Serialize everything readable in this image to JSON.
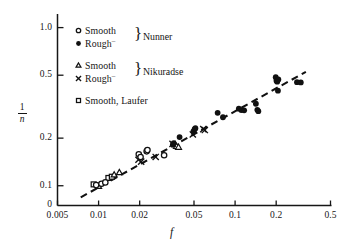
{
  "chart_data": {
    "type": "scatter",
    "title": "",
    "subtitle": "",
    "xlabel": "f",
    "ylabel": "1/n",
    "ylabel_numerator": "1",
    "ylabel_denominator": "n",
    "xscale": "log",
    "yscale": "log",
    "xlim": [
      0.005,
      0.5
    ],
    "ylim": [
      0.075,
      1.15
    ],
    "grid": false,
    "legend_position": "upper-left-inside",
    "xticks": [
      0.005,
      0.01,
      0.02,
      0.05,
      0.1,
      0.2,
      0.5
    ],
    "xticklabels": [
      "0.005",
      "0.01",
      "0.02",
      "0.05",
      "0.1",
      "0.2",
      "0.5"
    ],
    "yticks": [
      1.0,
      0.5,
      0.2,
      0.1
    ],
    "yticklabels": [
      "1.0",
      "0.5",
      "0.2",
      "0.1"
    ],
    "origin_label": "0",
    "annotations": [
      {
        "name": "trend-line",
        "type": "dashed-line",
        "x": [
          0.0074,
          0.33
        ],
        "y": [
          0.0845,
          0.525
        ]
      }
    ],
    "series": [
      {
        "name": "Smooth, Nunner",
        "marker": "open-circle",
        "source": "Nunner",
        "surface": "Smooth",
        "points": [
          {
            "x": 0.0096,
            "y": 0.101
          },
          {
            "x": 0.0105,
            "y": 0.103
          },
          {
            "x": 0.0112,
            "y": 0.105
          },
          {
            "x": 0.0197,
            "y": 0.158
          },
          {
            "x": 0.0203,
            "y": 0.152
          },
          {
            "x": 0.0225,
            "y": 0.165
          },
          {
            "x": 0.0228,
            "y": 0.168
          },
          {
            "x": 0.0302,
            "y": 0.156
          }
        ]
      },
      {
        "name": "Rough, Nunner",
        "marker": "filled-circle",
        "source": "Nunner",
        "surface": "Rough",
        "points": [
          {
            "x": 0.035,
            "y": 0.182
          },
          {
            "x": 0.0355,
            "y": 0.186
          },
          {
            "x": 0.0392,
            "y": 0.203
          },
          {
            "x": 0.0495,
            "y": 0.221
          },
          {
            "x": 0.0505,
            "y": 0.228
          },
          {
            "x": 0.0512,
            "y": 0.231
          },
          {
            "x": 0.0745,
            "y": 0.289
          },
          {
            "x": 0.0815,
            "y": 0.271
          },
          {
            "x": 0.1065,
            "y": 0.307
          },
          {
            "x": 0.111,
            "y": 0.301
          },
          {
            "x": 0.1165,
            "y": 0.3
          },
          {
            "x": 0.142,
            "y": 0.33
          },
          {
            "x": 0.1455,
            "y": 0.302
          },
          {
            "x": 0.148,
            "y": 0.296
          },
          {
            "x": 0.1985,
            "y": 0.486
          },
          {
            "x": 0.201,
            "y": 0.462
          },
          {
            "x": 0.2035,
            "y": 0.455
          },
          {
            "x": 0.206,
            "y": 0.399
          },
          {
            "x": 0.2075,
            "y": 0.47
          },
          {
            "x": 0.284,
            "y": 0.452
          },
          {
            "x": 0.303,
            "y": 0.45
          }
        ]
      },
      {
        "name": "Smooth, Nikuradse",
        "marker": "open-triangle",
        "source": "Nikuradse",
        "surface": "Smooth",
        "points": [
          {
            "x": 0.01,
            "y": 0.099
          },
          {
            "x": 0.013,
            "y": 0.117
          },
          {
            "x": 0.0142,
            "y": 0.121
          },
          {
            "x": 0.0372,
            "y": 0.177
          },
          {
            "x": 0.0385,
            "y": 0.175
          }
        ]
      },
      {
        "name": "Rough, Nikuradse",
        "marker": "cross",
        "source": "Nikuradse",
        "surface": "Rough",
        "points": [
          {
            "x": 0.0196,
            "y": 0.146
          },
          {
            "x": 0.0205,
            "y": 0.142
          },
          {
            "x": 0.0262,
            "y": 0.152
          },
          {
            "x": 0.0348,
            "y": 0.184
          },
          {
            "x": 0.049,
            "y": 0.211
          },
          {
            "x": 0.0585,
            "y": 0.228
          },
          {
            "x": 0.06,
            "y": 0.225
          }
        ]
      },
      {
        "name": "Smooth, Laufer",
        "marker": "open-square",
        "source": "Laufer",
        "surface": "Smooth",
        "points": [
          {
            "x": 0.0092,
            "y": 0.102
          },
          {
            "x": 0.0118,
            "y": 0.112
          },
          {
            "x": 0.0125,
            "y": 0.114
          }
        ]
      }
    ]
  },
  "legend": {
    "groups": [
      {
        "name": "nunner",
        "label": "Nunner",
        "rows": [
          {
            "marker": "open-circle",
            "text": "Smooth",
            "sup": ""
          },
          {
            "marker": "filled-circle",
            "text": "Rough",
            "sup": "–"
          }
        ]
      },
      {
        "name": "nikuradse",
        "label": "Nikuradse",
        "rows": [
          {
            "marker": "open-triangle",
            "text": "Smooth",
            "sup": ""
          },
          {
            "marker": "cross",
            "text": "Rough",
            "sup": "–"
          }
        ]
      },
      {
        "name": "laufer",
        "label": "",
        "rows": [
          {
            "marker": "open-square",
            "text": "Smooth, Laufer",
            "sup": ""
          }
        ]
      }
    ],
    "brace_glyph": "}"
  },
  "style": {
    "axis_color": "#161616",
    "marker_color": "#111111",
    "trend_color": "#111111",
    "background": "#ffffff"
  }
}
